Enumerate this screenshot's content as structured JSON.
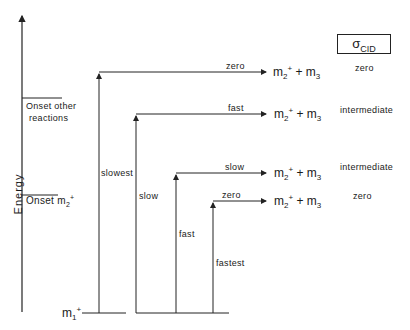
{
  "diagram": {
    "axis_label": "Energy",
    "onsets": [
      {
        "label_line1": "Onset other",
        "label_line2": "reactions"
      },
      {
        "label": "Onset m",
        "sub": "2",
        "sup": "+"
      }
    ],
    "reactant": {
      "label": "m",
      "sub": "1",
      "sup": "+"
    },
    "header": {
      "symbol": "σ",
      "sub": "CID"
    },
    "pathways": [
      {
        "excitation_rate": "slowest",
        "dissociation_rate": "zero",
        "product": "m2+ + m3",
        "sigma_cid": "zero"
      },
      {
        "excitation_rate": "slow",
        "dissociation_rate": "fast",
        "product": "m2+ + m3",
        "sigma_cid": "intermediate"
      },
      {
        "excitation_rate": "fast",
        "dissociation_rate": "slow",
        "product": "m2+ + m3",
        "sigma_cid": "intermediate"
      },
      {
        "excitation_rate": "fastest",
        "dissociation_rate": "zero",
        "product": "m2+ + m3",
        "sigma_cid": "zero"
      }
    ],
    "product_parts": {
      "m2": "m",
      "m2_sub": "2",
      "m2_sup": "+",
      "plus": " + ",
      "m3": "m",
      "m3_sub": "3"
    }
  }
}
